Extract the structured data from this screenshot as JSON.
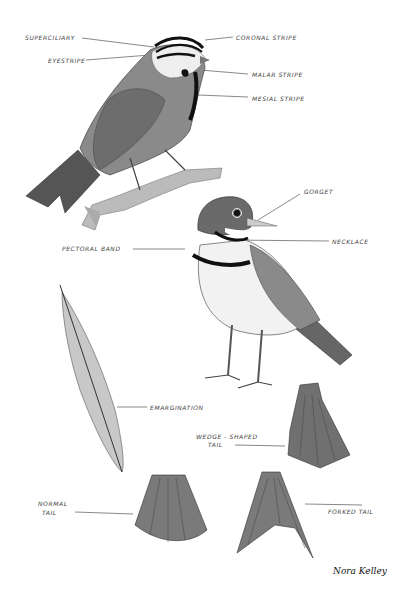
{
  "labels": {
    "superciliary": "Superciliary",
    "eyestripe": "Eyestripe",
    "coronal_stripe": "Coronal stripe",
    "malar_stripe": "Malar stripe",
    "mesial_stripe": "Mesial stripe",
    "gorget": "Gorget",
    "necklace": "Necklace",
    "pectoral_band": "Pectoral band",
    "emargination": "Emargination",
    "wedge_shaped_tail_1": "Wedge - shaped",
    "wedge_shaped_tail_2": "tail",
    "normal_tail_1": "Normal",
    "normal_tail_2": "tail",
    "forked_tail": "Forked tail"
  },
  "signature": "Nora Kelley"
}
